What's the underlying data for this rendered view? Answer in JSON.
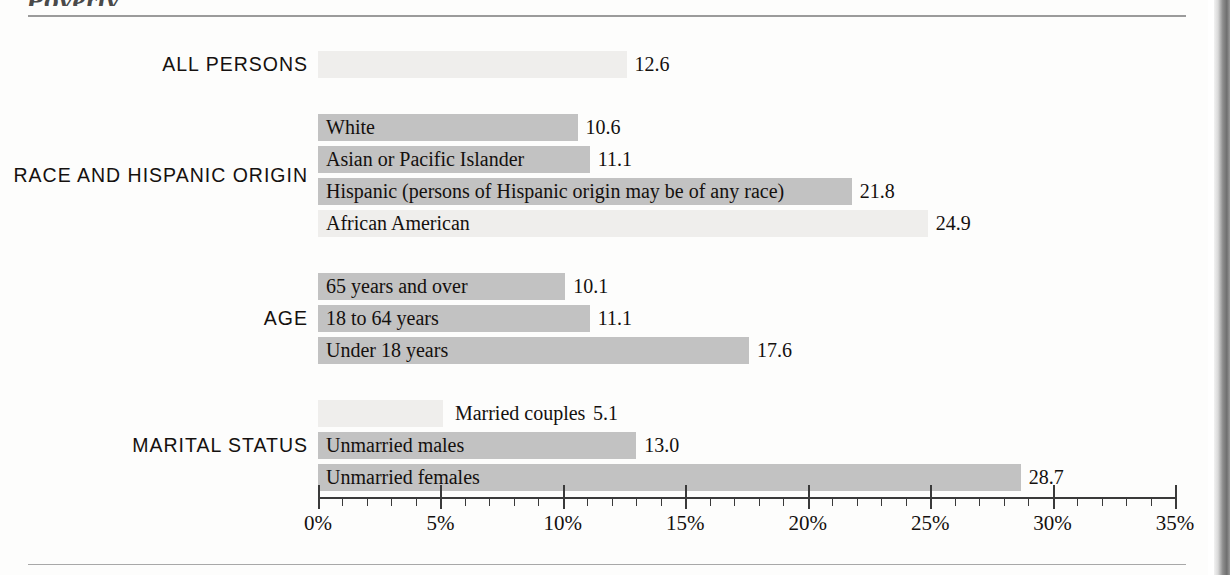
{
  "figure": {
    "title": "Poverty",
    "axis_unit": "%"
  },
  "chart_data": {
    "type": "bar",
    "orientation": "horizontal",
    "title": "Poverty",
    "xlabel": "",
    "ylabel": "",
    "xlim": [
      0,
      35
    ],
    "xticks": [
      0,
      5,
      10,
      15,
      20,
      25,
      30,
      35
    ],
    "xticklabels": [
      "0%",
      "5%",
      "10%",
      "15%",
      "20%",
      "25%",
      "30%",
      "35%"
    ],
    "minor_tick_interval": 1,
    "grid": false,
    "legend": null,
    "groups": [
      {
        "group_label": "ALL PERSONS",
        "bars": [
          {
            "label": "",
            "value": 12.6,
            "value_label": "12.6",
            "shade": "light",
            "label_inside": false
          }
        ]
      },
      {
        "group_label": "RACE AND HISPANIC ORIGIN",
        "bars": [
          {
            "label": "White",
            "value": 10.6,
            "value_label": "10.6",
            "shade": "dark",
            "label_inside": true
          },
          {
            "label": "Asian or Pacific Islander",
            "value": 11.1,
            "value_label": "11.1",
            "shade": "dark",
            "label_inside": true
          },
          {
            "label": "Hispanic (persons of Hispanic origin may be of any race)",
            "value": 21.8,
            "value_label": "21.8",
            "shade": "dark",
            "label_inside": true
          },
          {
            "label": "African American",
            "value": 24.9,
            "value_label": "24.9",
            "shade": "light",
            "label_inside": true
          }
        ]
      },
      {
        "group_label": "AGE",
        "bars": [
          {
            "label": "65 years and over",
            "value": 10.1,
            "value_label": "10.1",
            "shade": "dark",
            "label_inside": true
          },
          {
            "label": "18 to 64 years",
            "value": 11.1,
            "value_label": "11.1",
            "shade": "dark",
            "label_inside": true
          },
          {
            "label": "Under 18 years",
            "value": 17.6,
            "value_label": "17.6",
            "shade": "dark",
            "label_inside": true
          }
        ]
      },
      {
        "group_label": "MARITAL STATUS",
        "bars": [
          {
            "label": "Married couples",
            "value": 5.1,
            "value_label": "5.1",
            "shade": "light",
            "label_inside": false
          },
          {
            "label": "Unmarried males",
            "value": 13.0,
            "value_label": "13.0",
            "shade": "dark",
            "label_inside": true
          },
          {
            "label": "Unmarried females",
            "value": 28.7,
            "value_label": "28.7",
            "shade": "dark",
            "label_inside": true
          }
        ]
      }
    ]
  },
  "colors": {
    "bar_dark": "#c2c2c2",
    "bar_light": "#efeeec",
    "axis": "#3a3a3a",
    "text": "#14100e",
    "rule": "#9b9b9b"
  }
}
